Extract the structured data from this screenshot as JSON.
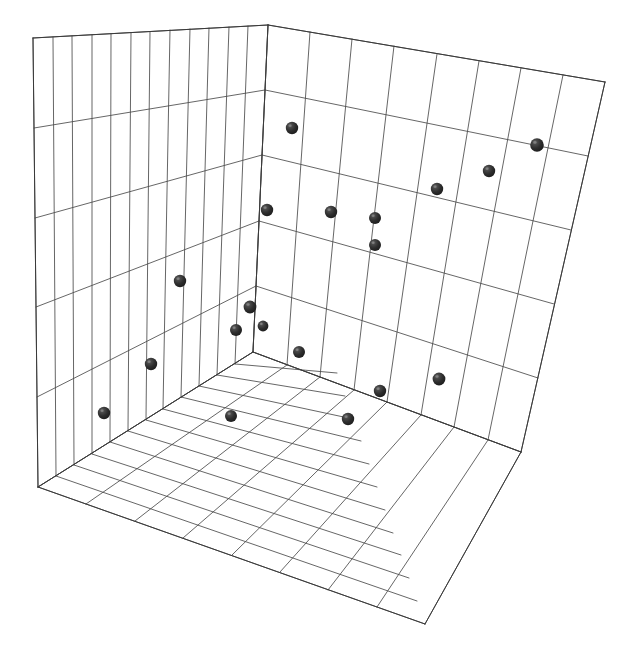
{
  "figure": {
    "title": "",
    "background_color": "#ffffff",
    "width": 628,
    "height": 671
  },
  "style": {
    "grid_line_color": "#4a4a4a",
    "axis_edge_color": "#3a3a3a",
    "marker_color": "#2b2b2b",
    "marker_highlight_color": "#8c8c8c",
    "pane_fill_color": "#ffffff",
    "marker_radius_px": 6.2
  },
  "chart_data": {
    "type": "scatter",
    "projection": "3d",
    "title": "",
    "subtitle": "",
    "xlabel": "",
    "ylabel": "",
    "zlabel": "",
    "legend": [],
    "annotations": [],
    "grid": true,
    "xticklabels": [],
    "yticklabels": [],
    "zticklabels": [],
    "xlim": [
      0,
      12
    ],
    "ylim": [
      0,
      8
    ],
    "zlim": [
      0,
      5
    ],
    "grid_divisions": {
      "left_wall_vertical": 12,
      "left_wall_horizontal": 5,
      "right_wall_vertical": 8,
      "right_wall_horizontal": 5,
      "floor_rows": 8,
      "floor_cols": 12
    },
    "n_points": 19,
    "points_px": [
      {
        "x": 292,
        "y": 128,
        "r": 6.2
      },
      {
        "x": 537,
        "y": 145,
        "r": 6.8
      },
      {
        "x": 489,
        "y": 171,
        "r": 6.2
      },
      {
        "x": 437,
        "y": 189,
        "r": 6.2
      },
      {
        "x": 267,
        "y": 210,
        "r": 6.2
      },
      {
        "x": 331,
        "y": 212,
        "r": 6.2
      },
      {
        "x": 375,
        "y": 218,
        "r": 6.0
      },
      {
        "x": 375,
        "y": 245,
        "r": 6.0
      },
      {
        "x": 180,
        "y": 281,
        "r": 6.2
      },
      {
        "x": 250,
        "y": 307,
        "r": 6.4
      },
      {
        "x": 236,
        "y": 330,
        "r": 6.0
      },
      {
        "x": 299,
        "y": 352,
        "r": 6.0
      },
      {
        "x": 151,
        "y": 364,
        "r": 6.2
      },
      {
        "x": 439,
        "y": 379,
        "r": 6.4
      },
      {
        "x": 380,
        "y": 391,
        "r": 6.2
      },
      {
        "x": 104,
        "y": 413,
        "r": 6.2
      },
      {
        "x": 231,
        "y": 416,
        "r": 6.0
      },
      {
        "x": 348,
        "y": 419,
        "r": 6.2
      },
      {
        "x": 263,
        "y": 326,
        "r": 5.4
      }
    ],
    "geometry_px": {
      "apex_top": [
        268,
        25
      ],
      "left_wall_top_left": [
        33,
        38
      ],
      "left_wall_bottom_left": [
        38,
        487
      ],
      "inner_corner": [
        253,
        352
      ],
      "right_wall_top_right": [
        605,
        82
      ],
      "right_wall_bottom_right": [
        521,
        452
      ],
      "floor_front_corner": [
        425,
        624
      ]
    }
  }
}
